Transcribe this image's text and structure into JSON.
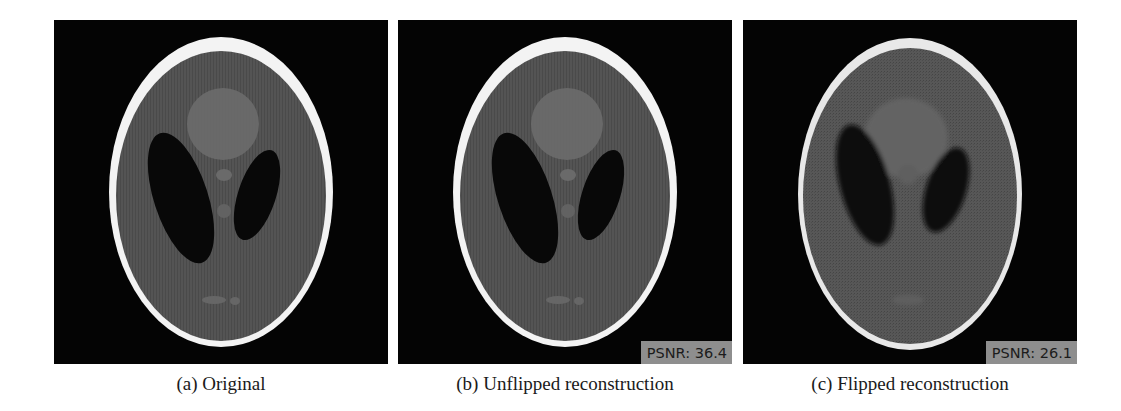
{
  "figure": {
    "panels": [
      {
        "id": "a",
        "caption": "(a) Original",
        "psnr": null
      },
      {
        "id": "b",
        "caption": "(b) Unflipped reconstruction",
        "psnr": "PSNR: 36.4"
      },
      {
        "id": "c",
        "caption": "(c) Flipped reconstruction",
        "psnr": "PSNR: 26.1"
      }
    ],
    "colors": {
      "background": "#040404",
      "skull": "#f2f2f2",
      "brain": "#555555",
      "ventricles": "#0a0a0a",
      "psnr_box": "#8e8e8e"
    }
  }
}
